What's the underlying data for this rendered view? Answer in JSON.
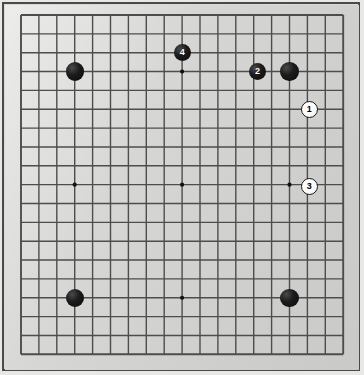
{
  "app": {
    "title": "Go Board Diagram",
    "board_label": "19x19 Go board diagram"
  },
  "board": {
    "size": 19,
    "origin_x": 21,
    "origin_y": 15,
    "cell_x": 17.9,
    "cell_y": 18.85,
    "line_color": "#4d4d4d",
    "line_width": 1.4,
    "border_line_width": 1.9,
    "board_color": "#d6d6d4",
    "frame_color": "#4a4a4a",
    "star_color": "#111111",
    "star_radius": 2.1,
    "star_points": [
      {
        "col": 3,
        "row": 3
      },
      {
        "col": 9,
        "row": 3
      },
      {
        "col": 15,
        "row": 3
      },
      {
        "col": 3,
        "row": 9
      },
      {
        "col": 9,
        "row": 9
      },
      {
        "col": 15,
        "row": 9
      },
      {
        "col": 3,
        "row": 15
      },
      {
        "col": 9,
        "row": 15
      },
      {
        "col": 15,
        "row": 15
      }
    ]
  },
  "stones": [
    {
      "id": "black-stone-d16",
      "color": "black",
      "col": 3,
      "row": 3,
      "label": "",
      "radius": 9.2
    },
    {
      "id": "black-stone-q16",
      "color": "black",
      "col": 15,
      "row": 3,
      "label": "",
      "radius": 9.2
    },
    {
      "id": "black-stone-d4",
      "color": "black",
      "col": 3,
      "row": 15,
      "label": "",
      "radius": 9.2
    },
    {
      "id": "black-stone-q4",
      "color": "black",
      "col": 15,
      "row": 15,
      "label": "",
      "radius": 9.2
    },
    {
      "id": "black-stone-move-4",
      "color": "black",
      "col": 9,
      "row": 2,
      "label": "4",
      "radius": 8.6
    },
    {
      "id": "black-stone-move-2",
      "color": "black",
      "col": 13.2,
      "row": 3,
      "label": "2",
      "radius": 8.6
    },
    {
      "id": "white-stone-move-1",
      "color": "white",
      "col": 16.1,
      "row": 5,
      "label": "1",
      "radius": 8.6
    },
    {
      "id": "white-stone-move-3",
      "color": "white",
      "col": 16.1,
      "row": 9.1,
      "label": "3",
      "radius": 8.6
    }
  ]
}
